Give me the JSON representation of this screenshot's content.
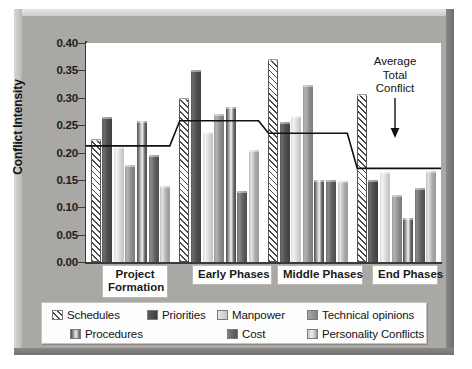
{
  "chart_data": {
    "type": "bar",
    "title": "",
    "xlabel": "",
    "ylabel": "Conflict Intensity",
    "ylim": [
      0.0,
      0.4
    ],
    "ytick_labels": [
      "0.40",
      "0.35",
      "0.30",
      "0.25",
      "0.20",
      "0.15",
      "0.10",
      "0.05",
      "0.00"
    ],
    "ytick_values": [
      0.4,
      0.35,
      0.3,
      0.25,
      0.2,
      0.15,
      0.1,
      0.05,
      0.0
    ],
    "grid": false,
    "legend_position": "bottom",
    "categories": [
      "Project Formation",
      "Early Phases",
      "Middle Phases",
      "End Phases"
    ],
    "series": [
      {
        "name": "Schedules",
        "values": [
          0.225,
          0.3,
          0.37,
          0.307
        ]
      },
      {
        "name": "Priorities",
        "values": [
          0.265,
          0.35,
          0.256,
          0.149
        ]
      },
      {
        "name": "Manpower",
        "values": [
          0.21,
          0.238,
          0.266,
          0.165
        ]
      },
      {
        "name": "Technical opinions",
        "values": [
          0.178,
          0.271,
          0.323,
          0.122
        ]
      },
      {
        "name": "Procedures",
        "values": [
          0.258,
          0.284,
          0.149,
          0.081
        ]
      },
      {
        "name": "Cost",
        "values": [
          0.196,
          0.129,
          0.149,
          0.135
        ]
      },
      {
        "name": "Personality Conflicts",
        "values": [
          0.139,
          0.204,
          0.148,
          0.166
        ]
      }
    ],
    "overlay_line": {
      "name": "Average Total Conflict",
      "values": [
        0.212,
        0.258,
        0.235,
        0.171
      ],
      "style": "step"
    },
    "annotation": {
      "line1": "Average",
      "line2": "Total",
      "line3": "Conflict",
      "arrow": "down-arrow"
    }
  },
  "legend": {
    "items": [
      {
        "label": "Schedules",
        "swatch": "hatched-swatch"
      },
      {
        "label": "Priorities",
        "swatch": "dark-gray-swatch"
      },
      {
        "label": "Manpower",
        "swatch": "light-gray-swatch"
      },
      {
        "label": "Technical opinions",
        "swatch": "mid-gray-swatch"
      },
      {
        "label": "Procedures",
        "swatch": "dark-highlight-swatch"
      },
      {
        "label": "Cost",
        "swatch": "medium-gray-swatch"
      },
      {
        "label": "Personality Conflicts",
        "swatch": "light-hatch-swatch"
      }
    ]
  }
}
